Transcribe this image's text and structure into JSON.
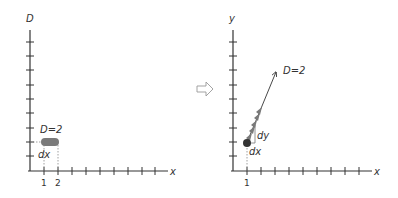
{
  "left_panel": {
    "y_axis_label": "D",
    "x_axis_label": "x",
    "x_ticks": [
      "1",
      "2"
    ],
    "annotation": "D=2",
    "interval_label": "dx",
    "tick_count_y": 9,
    "tick_count_x": 10,
    "blob_color": "#7a7a7a"
  },
  "transition_arrow": {
    "icon": "hollow-right-arrow-icon"
  },
  "right_panel": {
    "y_axis_label": "y",
    "x_axis_label": "x",
    "x_ticks": [
      "1"
    ],
    "annotation": "D=2",
    "dx_label": "dx",
    "dy_label": "dy",
    "tick_count_y": 9,
    "tick_count_x": 10,
    "arrow_color": "#777777",
    "point_color": "#333333"
  }
}
